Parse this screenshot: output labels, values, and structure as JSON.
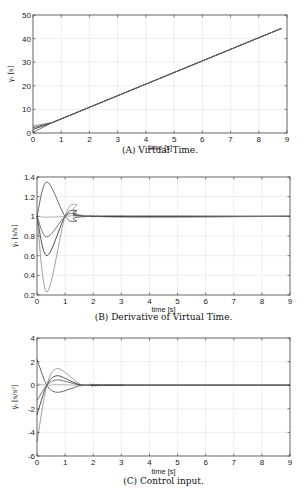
{
  "chart_data": [
    {
      "type": "line",
      "caption": "(A) Virtual Time.",
      "xlabel": "time [s]",
      "ylabel": "γᵢ [s]",
      "xlim": [
        0,
        9
      ],
      "ylim": [
        0,
        50
      ],
      "xticks": [
        0,
        1,
        2,
        3,
        4,
        5,
        6,
        7,
        8,
        9
      ],
      "yticks": [
        0,
        10,
        20,
        30,
        40,
        50
      ],
      "grid": true,
      "series": [
        {
          "name": "agent1",
          "x": [
            0,
            0.7,
            8.8
          ],
          "y": [
            0.3,
            4.5,
            44.3
          ],
          "color": "#555"
        },
        {
          "name": "agent2",
          "x": [
            0,
            0.7,
            8.8
          ],
          "y": [
            1.5,
            4.5,
            44.3
          ],
          "color": "#222"
        },
        {
          "name": "agent3",
          "x": [
            0,
            0.7,
            8.8
          ],
          "y": [
            2.2,
            4.5,
            44.3
          ],
          "color": "#333"
        },
        {
          "name": "agent4",
          "x": [
            0,
            0.7,
            8.8
          ],
          "y": [
            3.0,
            4.5,
            44.3
          ],
          "color": "#777"
        }
      ]
    },
    {
      "type": "line",
      "caption": "(B) Derivative of Virtual Time.",
      "xlabel": "time [s]",
      "ylabel": "γ̇ᵢ [s/s]",
      "xlim": [
        0,
        9
      ],
      "ylim": [
        0.2,
        1.4
      ],
      "xticks": [
        0,
        1,
        2,
        3,
        4,
        5,
        6,
        7,
        8,
        9
      ],
      "yticks": [
        0.2,
        0.4,
        0.6,
        0.8,
        1,
        1.2,
        1.4
      ],
      "grid": true,
      "series": [
        {
          "name": "agent1",
          "x": [
            0,
            0.35,
            1.0,
            1.4,
            2.0,
            9
          ],
          "y": [
            1.0,
            1.35,
            1.0,
            0.95,
            1.0,
            1.0
          ],
          "color": "#444"
        },
        {
          "name": "agent2",
          "x": [
            0,
            0.35,
            1.0,
            1.4,
            2.0,
            9
          ],
          "y": [
            1.0,
            0.99,
            1.0,
            1.01,
            1.0,
            1.0
          ],
          "color": "#aaa"
        },
        {
          "name": "agent3",
          "x": [
            0,
            0.35,
            1.0,
            1.4,
            2.0,
            9
          ],
          "y": [
            1.0,
            0.79,
            1.0,
            1.03,
            1.0,
            1.0
          ],
          "color": "#555"
        },
        {
          "name": "agent4",
          "x": [
            0,
            0.35,
            1.0,
            1.4,
            2.0,
            9
          ],
          "y": [
            1.0,
            0.6,
            1.0,
            1.06,
            1.0,
            1.0
          ],
          "color": "#222"
        },
        {
          "name": "agent5",
          "x": [
            0,
            0.35,
            1.0,
            1.4,
            2.0,
            9
          ],
          "y": [
            1.0,
            0.23,
            1.0,
            1.12,
            1.0,
            1.0
          ],
          "color": "#888"
        }
      ]
    },
    {
      "type": "line",
      "caption": "(C) Control input.",
      "xlabel": "time [s]",
      "ylabel": "γ̈ᵢ [s/s²]",
      "xlim": [
        0,
        9
      ],
      "ylim": [
        -6,
        4
      ],
      "xticks": [
        0,
        1,
        2,
        3,
        4,
        5,
        6,
        7,
        8,
        9
      ],
      "yticks": [
        -6,
        -4,
        -2,
        0,
        2,
        4
      ],
      "grid": true,
      "series": [
        {
          "name": "agent1",
          "x": [
            0,
            0.35,
            0.7,
            1.2,
            1.6,
            2.2,
            9
          ],
          "y": [
            2.2,
            0,
            -0.6,
            -0.3,
            0,
            0,
            0
          ],
          "color": "#444"
        },
        {
          "name": "agent2",
          "x": [
            0,
            0.35,
            0.7,
            1.2,
            1.6,
            2.2,
            9
          ],
          "y": [
            0.1,
            0,
            0.05,
            0.02,
            0,
            0,
            0
          ],
          "color": "#aaa"
        },
        {
          "name": "agent3",
          "x": [
            0,
            0.35,
            0.7,
            1.2,
            1.6,
            2.2,
            9
          ],
          "y": [
            -1.3,
            0,
            0.45,
            0.2,
            0,
            0,
            0
          ],
          "color": "#555"
        },
        {
          "name": "agent4",
          "x": [
            0,
            0.35,
            0.7,
            1.2,
            1.6,
            2.2,
            9
          ],
          "y": [
            -2.5,
            0,
            0.8,
            0.35,
            0,
            0,
            0
          ],
          "color": "#222"
        },
        {
          "name": "agent5",
          "x": [
            0,
            0.35,
            0.7,
            1.2,
            1.6,
            2.2,
            9
          ],
          "y": [
            -4.8,
            0,
            1.4,
            0.7,
            0,
            0,
            0
          ],
          "color": "#888"
        }
      ]
    }
  ],
  "plots": [
    {
      "id": "A",
      "box": [
        33,
        15,
        287,
        133
      ],
      "caption_y": 153,
      "xlabel_y": 150
    },
    {
      "id": "B",
      "box": [
        37,
        177,
        290,
        295
      ],
      "caption_y": 320,
      "xlabel_y": 312
    },
    {
      "id": "C",
      "box": [
        37,
        338,
        290,
        456
      ],
      "caption_y": 484,
      "xlabel_y": 474
    }
  ]
}
